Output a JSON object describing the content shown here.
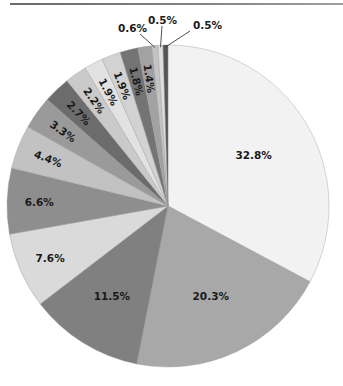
{
  "chart_data": {
    "type": "pie",
    "title": "",
    "start_angle_deg": 0,
    "direction": "clockwise",
    "center": [
      168,
      206
    ],
    "radius": 161,
    "slices": [
      {
        "label": "32.8%",
        "value": 32.8,
        "color": "#f2f2f2"
      },
      {
        "label": "20.3%",
        "value": 20.3,
        "color": "#a8a8a8"
      },
      {
        "label": "11.5%",
        "value": 11.5,
        "color": "#808080"
      },
      {
        "label": "7.6%",
        "value": 7.6,
        "color": "#dadada"
      },
      {
        "label": "6.6%",
        "value": 6.6,
        "color": "#8e8e8e"
      },
      {
        "label": "4.4%",
        "value": 4.4,
        "color": "#c2c2c2"
      },
      {
        "label": "3.3%",
        "value": 3.3,
        "color": "#9a9a9a"
      },
      {
        "label": "2.7%",
        "value": 2.7,
        "color": "#6c6c6c"
      },
      {
        "label": "2.2%",
        "value": 2.2,
        "color": "#cacaca"
      },
      {
        "label": "1.9%",
        "value": 1.9,
        "color": "#e2e2e2"
      },
      {
        "label": "1.9%",
        "value": 1.9,
        "color": "#d2d2d2"
      },
      {
        "label": "1.8%",
        "value": 1.8,
        "color": "#747474"
      },
      {
        "label": "1.4%",
        "value": 1.4,
        "color": "#a2a2a2"
      },
      {
        "label": "0.6%",
        "value": 0.6,
        "color": "#c4c4c4"
      },
      {
        "label": "0.5%",
        "value": 0.5,
        "color": "#dedede"
      },
      {
        "label": "0.5%",
        "value": 0.5,
        "color": "#555555"
      }
    ],
    "external_labels": [
      {
        "index": 13,
        "text": "0.6%",
        "x": 118,
        "y": 32
      },
      {
        "index": 14,
        "text": "0.5%",
        "x": 148,
        "y": 24
      },
      {
        "index": 15,
        "text": "0.5%",
        "x": 193,
        "y": 29
      }
    ],
    "legend": null
  }
}
